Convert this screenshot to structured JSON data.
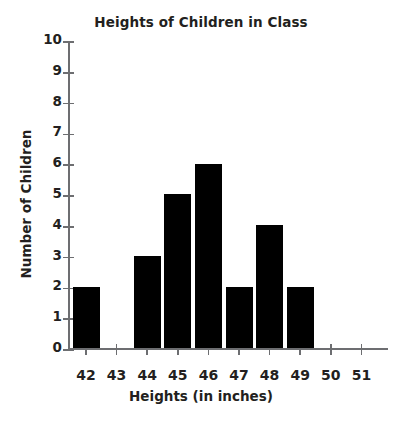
{
  "chart_data": {
    "type": "bar",
    "title": "Heights of Children in Class",
    "xlabel": "Heights (in inches)",
    "ylabel": "Number of Children",
    "categories": [
      "42",
      "43",
      "44",
      "45",
      "46",
      "47",
      "48",
      "49",
      "50",
      "51"
    ],
    "values": [
      2,
      0,
      3,
      5,
      6,
      2,
      4,
      2,
      0,
      0
    ],
    "xlim": [
      "42",
      "51"
    ],
    "ylim": [
      0,
      10
    ],
    "ytick_labels": [
      "0",
      "1",
      "2",
      "3",
      "4",
      "5",
      "6",
      "7",
      "8",
      "9",
      "10"
    ],
    "ytick_values": [
      0,
      1,
      2,
      3,
      4,
      5,
      6,
      7,
      8,
      9,
      10
    ],
    "grid": false,
    "legend": null,
    "bar_color": "#000000",
    "axis_color": "#6d6e71",
    "text_color": "#231f20",
    "background_color": "#ffffff"
  }
}
